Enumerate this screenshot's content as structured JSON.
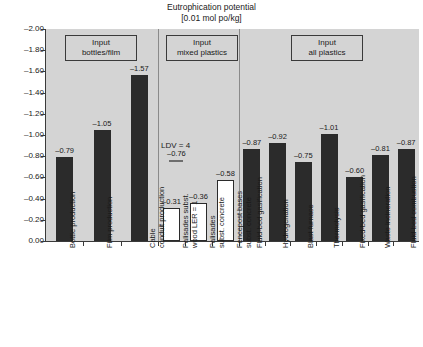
{
  "chart_data": {
    "type": "bar",
    "title": "Eutrophication potential",
    "subtitle": "[0.01 mol po/kg]",
    "xlabel": "",
    "ylabel": "",
    "ylim": [
      -2.0,
      0.0
    ],
    "y_tick_labels": [
      "-2.00",
      "-1.80",
      "-1.60",
      "-1.40",
      "-1.20",
      "-1.00",
      "-0.80",
      "-0.60",
      "-0.40",
      "-0.20",
      "0.00"
    ],
    "y_tick_values": [
      -2.0,
      -1.8,
      -1.6,
      -1.4,
      -1.2,
      -1.0,
      -0.8,
      -0.6,
      -0.4,
      -0.2,
      0.0
    ],
    "grid": false,
    "legend": null,
    "groups": [
      {
        "header_line1": "Input",
        "header_line2": "bottles/film",
        "bar_style": "dark",
        "categories": [
          {
            "line1": "Bottle production",
            "line2": ""
          },
          {
            "line1": "Film production",
            "line2": ""
          },
          {
            "line1": "Cable",
            "line2": "conduit production"
          }
        ],
        "values": [
          -0.79,
          -1.05,
          -1.57
        ],
        "value_labels": [
          "-0.79",
          "-1.05",
          "-1.57"
        ]
      },
      {
        "header_line1": "Input",
        "header_line2": "mixed plastics",
        "bar_style": "light",
        "categories": [
          {
            "line1": "Palisades subst.",
            "line2": "wood LER = 1"
          },
          {
            "line1": "Palisades",
            "line2": "subst. concrete"
          },
          {
            "line1": "Fencepost bases",
            "line2": "subst. concrete"
          }
        ],
        "values": [
          -0.31,
          -0.36,
          -0.58
        ],
        "value_labels": [
          "-0.31",
          "-0.36",
          "-0.58"
        ],
        "annotation": {
          "text": "LDV = 4",
          "value_label": "-0.76",
          "value": -0.76
        }
      },
      {
        "header_line1": "Input",
        "header_line2": "all plastics",
        "bar_style": "dark",
        "categories": [
          {
            "line1": "Fluid-bed gasification",
            "line2": ""
          },
          {
            "line1": "Hydrogenation",
            "line2": ""
          },
          {
            "line1": "Blast furnace",
            "line2": ""
          },
          {
            "line1": "Thermolysis",
            "line2": ""
          },
          {
            "line1": "Fixed-bed gasification",
            "line2": ""
          },
          {
            "line1": "Waste incineration",
            "line2": ""
          },
          {
            "line1": "Fluid-bed combustion",
            "line2": ""
          }
        ],
        "values": [
          -0.87,
          -0.92,
          -0.75,
          -1.01,
          -0.6,
          -0.81,
          -0.87
        ],
        "value_labels": [
          "-0.87",
          "-0.92",
          "-0.75",
          "-1.01",
          "-0.60",
          "-0.81",
          "-0.87"
        ]
      }
    ],
    "colors": {
      "plot_background": "#d4d4d4",
      "bar_dark": "#2b2b2b",
      "bar_light": "#ffffff",
      "axis": "#3a3a3a",
      "separator": "#8a8a8a",
      "text": "#1a1a1a"
    }
  }
}
